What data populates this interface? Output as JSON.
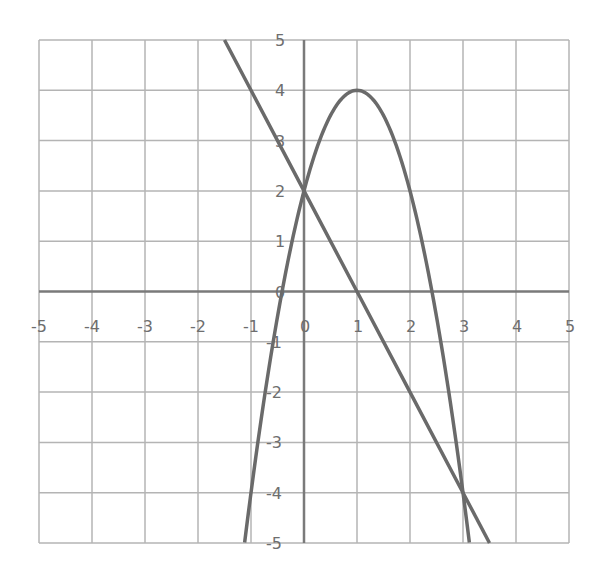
{
  "chart_data": {
    "type": "line",
    "title": "",
    "xlabel": "",
    "ylabel": "",
    "xlim": [
      -5,
      5
    ],
    "ylim": [
      -5,
      5
    ],
    "grid": true,
    "x_ticks": [
      "-5",
      "-4",
      "-3",
      "-2",
      "-1",
      "0",
      "1",
      "2",
      "3",
      "4",
      "5"
    ],
    "y_ticks": [
      "5",
      "4",
      "3",
      "2",
      "1",
      "0",
      "-1",
      "-2",
      "-3",
      "-4",
      "-5"
    ],
    "series": [
      {
        "name": "line",
        "equation": "y = -2x + 2",
        "x": [
          -1.5,
          -1,
          0,
          1,
          2,
          3,
          3.5
        ],
        "y": [
          5,
          4,
          2,
          0,
          -2,
          -4,
          -5
        ]
      },
      {
        "name": "parabola",
        "equation": "y = -2x^2 + 4x + 2",
        "x": [
          -1.12,
          -1,
          -0.5,
          0,
          0.5,
          1,
          1.5,
          2,
          2.5,
          3,
          3.12
        ],
        "y": [
          -5,
          -4,
          -0.5,
          2,
          3.5,
          4,
          3.5,
          2,
          -0.5,
          -4,
          -5
        ]
      }
    ],
    "colors": {
      "grid": "#b4b4b4",
      "axis": "#7a7a7a",
      "curve": "#6a6a6a"
    }
  }
}
